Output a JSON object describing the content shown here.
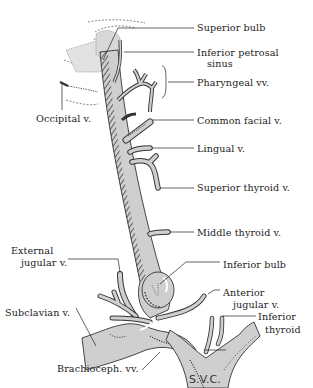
{
  "figure": {
    "colors": {
      "background": "#ffffff",
      "vein_fill": "#cfcfcf",
      "outline": "#333333",
      "hatch": "#2a2a2a",
      "label_text": "#222222"
    }
  },
  "labels": {
    "superior_bulb": "Superior bulb",
    "inferior_petrosal_1": "Inferior petrosal",
    "inferior_petrosal_2": "sinus",
    "pharyngeal": "Pharyngeal vv.",
    "occipital": "Occipital v.",
    "common_facial": "Common facial v.",
    "lingual": "Lingual v.",
    "superior_thyroid": "Superior thyroid v.",
    "middle_thyroid": "Middle thyroid v.",
    "external_jugular_1": "External",
    "external_jugular_2": "jugular v.",
    "inferior_bulb": "Inferior bulb",
    "anterior_jugular_1": "Anterior",
    "anterior_jugular_2": "jugular v.",
    "inferior_thyroid_1": "Inferior",
    "inferior_thyroid_2": "thyroid",
    "subclavian": "Subclavian v.",
    "brachiocephalic": "Brachioceph. vv.",
    "svc": "S.V.C."
  }
}
